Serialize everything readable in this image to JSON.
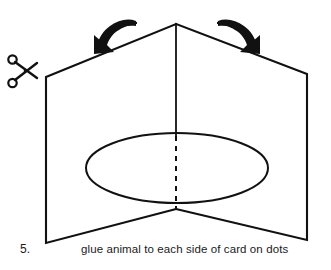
{
  "illustration": {
    "title": "Folded card with glue spot",
    "step_number": "5.",
    "instruction": "glue animal to each side of card on dots",
    "icons": {
      "scissors": "scissors-icon",
      "left_arrow": "curved-arrow-down-left-icon",
      "right_arrow": "curved-arrow-down-right-icon"
    },
    "colors": {
      "line": "#111111",
      "background": "#ffffff",
      "text": "#1a1a1a"
    },
    "geometry": {
      "apex": [
        176,
        24
      ],
      "top_left_corner": [
        46,
        77
      ],
      "top_right_corner": [
        307,
        74
      ],
      "bottom_left_corner": [
        46,
        243
      ],
      "bottom_right_corner": [
        307,
        240
      ],
      "bottom_center": [
        176,
        209
      ],
      "fold_line_solid": [
        [
          176,
          24
        ],
        [
          176,
          136
        ]
      ],
      "fold_line_dashed": [
        [
          176,
          136
        ],
        [
          176,
          209
        ]
      ],
      "glue_ellipse": {
        "cx": 177,
        "cy": 168,
        "rx": 91,
        "ry": 35
      }
    }
  }
}
